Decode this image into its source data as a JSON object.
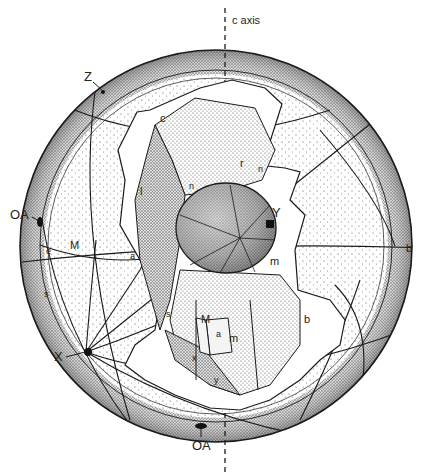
{
  "figure": {
    "type": "crystal stereographic projection diagram",
    "axis_label": "c axis",
    "direction_labels": {
      "Z": "Z",
      "X": "X",
      "Y": "Y",
      "OA_upper": "OA",
      "OA_lower": "OA"
    },
    "face_labels": {
      "c": "c",
      "r": "r",
      "l": "l",
      "n_upper": "n",
      "n_right": "n",
      "M_left": "M",
      "a_left": "a",
      "b_right": "b",
      "m_center": "m",
      "s_left": "s",
      "s_crystal": "s",
      "M_crystal": "M",
      "a_crystal": "a",
      "m_crystal": "m",
      "b_crystal": "b",
      "x_crystal": "x",
      "y_crystal": "y",
      "e_left": "e"
    },
    "colors": {
      "ink": "#1a1a1a",
      "paper": "#ffffff",
      "stipple_light": "#d9d9d9",
      "stipple_dark": "#8a8a8a"
    }
  }
}
